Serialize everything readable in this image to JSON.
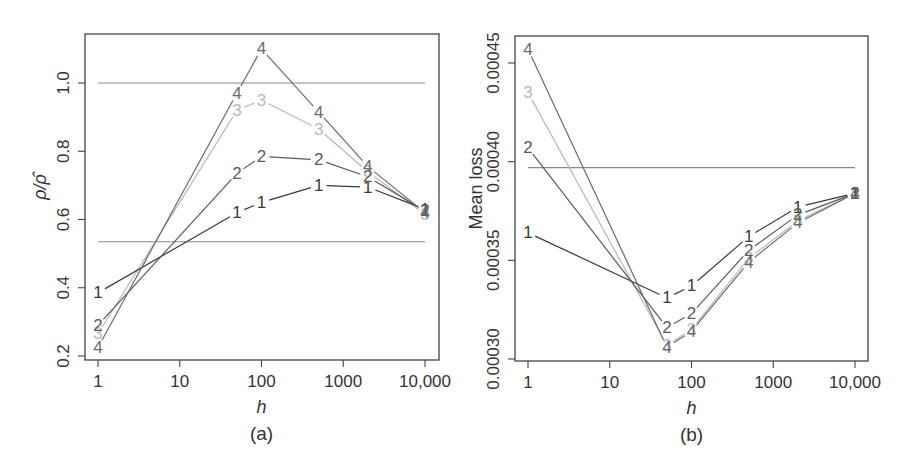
{
  "chart_data": [
    {
      "type": "line",
      "panel_label": "(a)",
      "xlabel": "h",
      "ylabel": "ρ/ρ̂",
      "x_scale": "log",
      "x": [
        1,
        50,
        100,
        500,
        2000,
        10000
      ],
      "xticks": [
        1,
        10,
        100,
        1000,
        10000
      ],
      "xtick_labels": [
        "1",
        "10",
        "100",
        "1000",
        "10,000"
      ],
      "ylim": [
        0.2,
        1.12
      ],
      "yticks": [
        0.2,
        0.4,
        0.6,
        0.8,
        1.0
      ],
      "ytick_labels": [
        "0.2",
        "0.4",
        "0.6",
        "0.8",
        "1.0"
      ],
      "grid": false,
      "reference_lines": [
        1.0,
        0.535
      ],
      "series": [
        {
          "name": "1",
          "color": "#3a3a3a",
          "values": [
            0.385,
            0.62,
            0.65,
            0.7,
            0.695,
            0.63
          ]
        },
        {
          "name": "2",
          "color": "#5a5a5a",
          "values": [
            0.29,
            0.735,
            0.785,
            0.775,
            0.725,
            0.625
          ]
        },
        {
          "name": "3",
          "color": "#b8b8b8",
          "values": [
            0.265,
            0.92,
            0.95,
            0.865,
            0.74,
            0.615
          ]
        },
        {
          "name": "4",
          "color": "#6a6a6a",
          "values": [
            0.225,
            0.97,
            1.1,
            0.915,
            0.755,
            0.62
          ]
        }
      ]
    },
    {
      "type": "line",
      "panel_label": "(b)",
      "xlabel": "h",
      "ylabel": "Mean loss",
      "x_scale": "log",
      "x": [
        1,
        50,
        100,
        500,
        2000,
        10000
      ],
      "xticks": [
        1,
        10,
        100,
        1000,
        10000
      ],
      "xtick_labels": [
        "1",
        "10",
        "100",
        "1000",
        "10,000"
      ],
      "ylim": [
        0.0003,
        0.00046
      ],
      "yticks": [
        0.0003,
        0.00035,
        0.0004,
        0.00045
      ],
      "ytick_labels": [
        "0.00030",
        "0.00035",
        "0.00040",
        "0.00045"
      ],
      "grid": false,
      "reference_lines": [
        0.000397
      ],
      "series": [
        {
          "name": "1",
          "color": "#3a3a3a",
          "values": [
            0.000364,
            0.000331,
            0.000337,
            0.000362,
            0.000377,
            0.000384
          ]
        },
        {
          "name": "2",
          "color": "#5a5a5a",
          "values": [
            0.000407,
            0.000316,
            0.000323,
            0.000355,
            0.000373,
            0.000384
          ]
        },
        {
          "name": "3",
          "color": "#b8b8b8",
          "values": [
            0.000435,
            0.000307,
            0.000315,
            0.000351,
            0.00037,
            0.000384
          ]
        },
        {
          "name": "4",
          "color": "#6a6a6a",
          "values": [
            0.000457,
            0.000306,
            0.000314,
            0.000349,
            0.000369,
            0.000384
          ]
        }
      ]
    }
  ],
  "panels": [
    {
      "frame": {
        "left": 85,
        "top": 34,
        "right": 439,
        "bottom": 360
      },
      "x_px": {
        "1": 98,
        "10": 180,
        "100": 261,
        "1000": 343,
        "10000": 425
      },
      "y_px": {
        "v0": 0.2,
        "p0": 356,
        "v1": 1.0,
        "p1": 83
      },
      "refline_color": "#8a8a8a"
    },
    {
      "frame": {
        "left": 515,
        "top": 36,
        "right": 868,
        "bottom": 361
      },
      "x_px": {
        "1": 528,
        "10": 610,
        "100": 691,
        "1000": 773,
        "10000": 855
      },
      "y_px": {
        "v0": 0.0003,
        "p0": 359,
        "v1": 0.00045,
        "p1": 63
      },
      "refline_color": "#8a8a8a"
    }
  ]
}
